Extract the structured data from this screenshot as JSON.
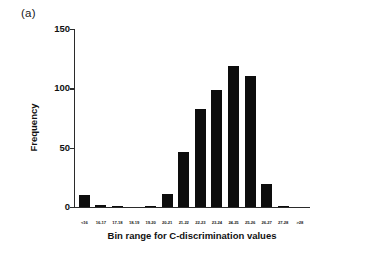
{
  "figure": {
    "panel_label": "(a)"
  },
  "chart_data": {
    "type": "bar",
    "title": "",
    "xlabel": "Bin range for C-discrimination values",
    "ylabel": "Frequency",
    "categories": [
      "<16",
      "16-17",
      "17-18",
      "18-19",
      "19-20",
      "20-21",
      "21-22",
      "22-23",
      "23-24",
      "24-25",
      "25-26",
      "26-27",
      "27-28",
      ">28"
    ],
    "values": [
      10,
      2,
      1,
      0,
      1,
      11,
      46,
      83,
      99,
      119,
      110,
      19,
      1,
      0
    ],
    "ylim": [
      0,
      150
    ],
    "yticks": [
      0,
      50,
      100,
      150
    ],
    "ytick_labels": [
      "0",
      "50",
      "100",
      "150"
    ],
    "grid": false,
    "legend": "none",
    "bar_color": "#0d0d0d",
    "axis_color": "#2b2b2b"
  }
}
